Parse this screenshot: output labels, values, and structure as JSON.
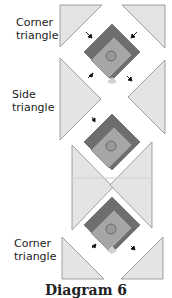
{
  "labels": {
    "corner_top": [
      "Corner",
      "triangle"
    ],
    "side": [
      "Side",
      "triangle"
    ],
    "corner_bottom": [
      "Corner",
      "triangle"
    ]
  },
  "caption": "Diagram 6",
  "colors": {
    "triangle_fill": "#e4e4e4",
    "triangle_stroke": "#8a8a8a",
    "dark_border": "#6e6e6e",
    "block_fill": "#a6a6a6",
    "circle_fill": "#999999",
    "light_tip": "#d0d0d0"
  },
  "blocks": [
    {
      "cx": 112,
      "cy": 52
    },
    {
      "cx": 112,
      "cy": 142
    },
    {
      "cx": 112,
      "cy": 225
    }
  ]
}
